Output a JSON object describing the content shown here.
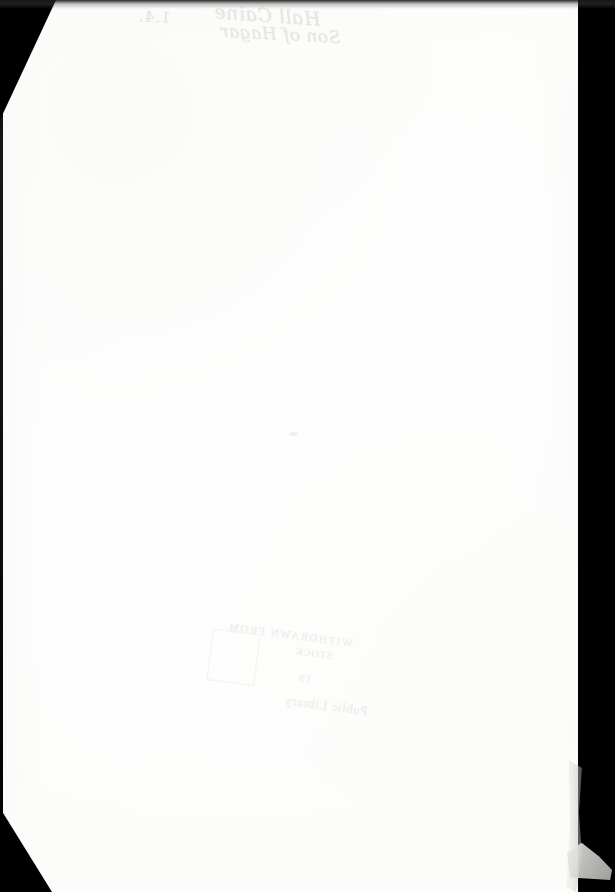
{
  "document": {
    "kind": "scanned-book-page",
    "surface": "blank endpaper",
    "width_px": 615,
    "height_px": 892,
    "paper_color": "#ffffff",
    "bed_color": "#000000",
    "ink_color": "#d9d9d6"
  },
  "handwriting": {
    "label": "pencil annotation, mirrored show-through",
    "shelfmark": "1.4.",
    "name_line_1": "Hall Caine",
    "name_line_2": "Son of Hagar"
  },
  "library_stamp": {
    "label": "library ownership stamp, mirrored show-through",
    "line_top": "WITHDRAWN FROM",
    "line_mid": "STOCK",
    "line_date": "19",
    "line_bottom": "Public Library"
  },
  "artifacts": {
    "corner_top_left": "cut corner",
    "corner_bottom_left": "cut corner",
    "right_margin": "scanner bed",
    "bottom_right": "torn page fragment"
  }
}
